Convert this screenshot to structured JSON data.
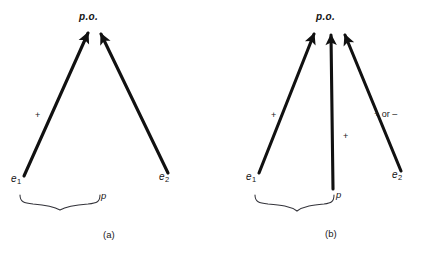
{
  "figure": {
    "background_color": "#ffffff",
    "stroke_color": "#111111",
    "panels": [
      {
        "caption": "(a)",
        "target_label": "p.o.",
        "nodes": [
          {
            "label_main": "e",
            "label_sub": "1"
          },
          {
            "label_main": "e",
            "label_sub": "2"
          }
        ],
        "edge_signs": [
          "+"
        ],
        "brace_label": "p"
      },
      {
        "caption": "(b)",
        "target_label": "p.o.",
        "nodes": [
          {
            "label_main": "e",
            "label_sub": "1"
          },
          {
            "label_main": "e",
            "label_sub": "2"
          }
        ],
        "edge_signs": [
          "+",
          "+",
          "+ or –"
        ],
        "brace_label": "p"
      }
    ]
  }
}
